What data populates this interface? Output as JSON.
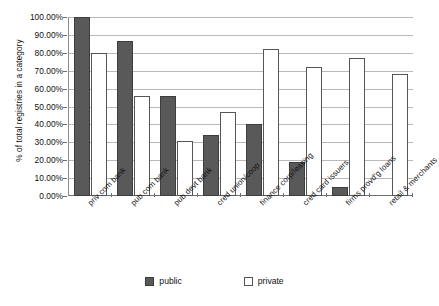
{
  "chart_data": {
    "type": "bar",
    "title": "",
    "xlabel": "",
    "ylabel": "% of total registries in a category",
    "ylim": [
      0,
      100
    ],
    "yticks": [
      0,
      10,
      20,
      30,
      40,
      50,
      60,
      70,
      80,
      90,
      100
    ],
    "ytick_labels": [
      "0.00%",
      "10.00%",
      "20.00%",
      "30.00%",
      "40.00%",
      "50.00%",
      "60.00%",
      "70.00%",
      "80.00%",
      "90.00%",
      "100.00%"
    ],
    "grid": true,
    "legend_position": "bottom",
    "categories": [
      "priv com bank",
      "pub com bank",
      "pub devt bank",
      "cred union/coop",
      "finance corp/leasing",
      "cred card issuers",
      "firms provd'g loans",
      "retail & merchants"
    ],
    "series": [
      {
        "name": "public",
        "color": "#595959",
        "values": [
          100,
          86.5,
          56,
          34,
          40,
          19,
          5,
          0
        ]
      },
      {
        "name": "private",
        "color": "#ffffff",
        "values": [
          80,
          56,
          31,
          47,
          82,
          72,
          77,
          68
        ]
      }
    ]
  },
  "legend": {
    "items": [
      {
        "label": "public"
      },
      {
        "label": "private"
      }
    ]
  }
}
